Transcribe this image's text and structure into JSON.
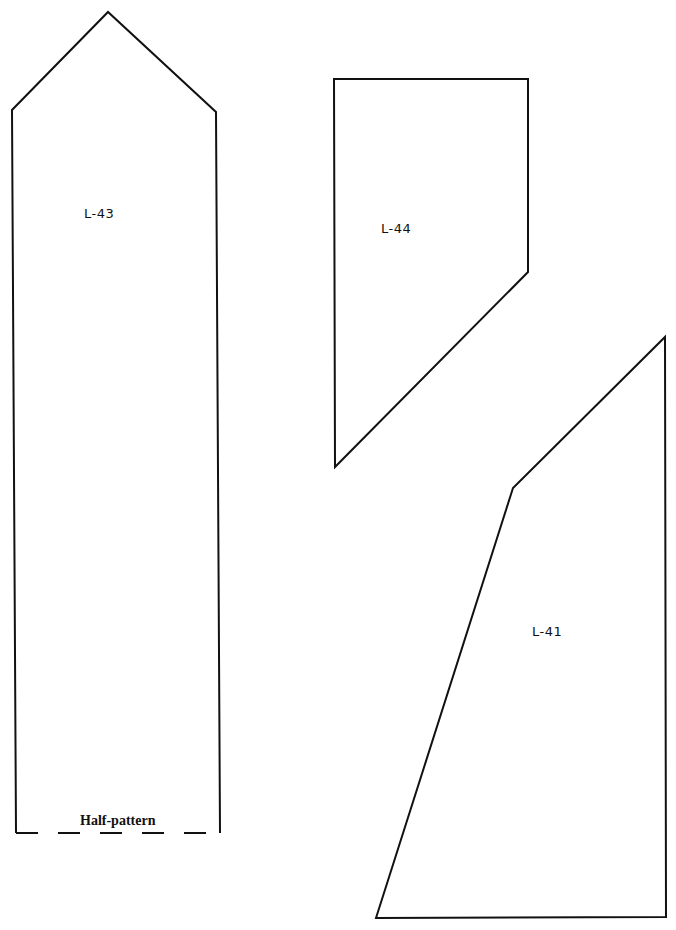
{
  "pieces": [
    {
      "id": "L-43",
      "label": "L-43",
      "points": "16,833 12,110 108,12 216,112 220,833",
      "label_pos": {
        "x": 84,
        "y": 215
      },
      "note": "Half-pattern"
    },
    {
      "id": "L-44",
      "label": "L-44",
      "points": "335,467 334,79 528,79 528,272",
      "label_pos": {
        "x": 381,
        "y": 230
      }
    },
    {
      "id": "L-41",
      "label": "L-41",
      "points": "376,918 513,488 665,337 666,917",
      "label_pos": {
        "x": 532,
        "y": 633
      }
    }
  ],
  "half_pattern_edge": {
    "x1": 16,
    "y1": 833,
    "x2": 220,
    "y2": 833
  },
  "colors": {
    "stroke": "#111111",
    "background": "#ffffff"
  }
}
